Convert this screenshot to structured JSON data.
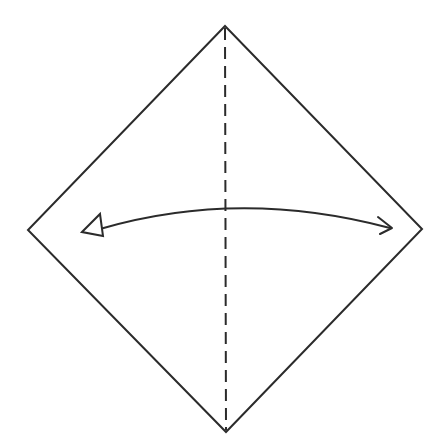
{
  "diagram": {
    "type": "origami-step",
    "colors": {
      "line": "#2b2b2b",
      "background": "#ffffff"
    },
    "paper": {
      "shape": "diamond",
      "vertices": {
        "top": [
          225,
          26
        ],
        "right": [
          422,
          229
        ],
        "bottom": [
          226,
          432
        ],
        "left": [
          28,
          230
        ]
      }
    },
    "fold_line": {
      "style": "dashed",
      "kind": "valley-fold",
      "from": [
        225,
        26
      ],
      "to": [
        226,
        432
      ]
    },
    "arrow": {
      "kind": "fold-and-unfold",
      "start": [
        84,
        232
      ],
      "end": [
        392,
        228
      ],
      "left_head": "hollow-triangle",
      "right_head": "open-chevron"
    }
  }
}
